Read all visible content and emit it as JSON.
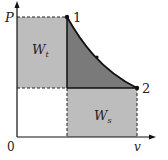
{
  "diagram": {
    "type": "P-v thermodynamic diagram",
    "axes": {
      "y_label": "P",
      "x_label": "v",
      "origin_label": "0"
    },
    "points": [
      {
        "id": "1",
        "label": "1"
      },
      {
        "id": "2",
        "label": "2"
      }
    ],
    "regions": {
      "left_region": {
        "main": "W",
        "sub": "t"
      },
      "bottom_region": {
        "main": "W",
        "sub": "s"
      }
    },
    "colors": {
      "light_fill": "#bdbdbd",
      "dark_fill": "#7a7a7a",
      "line": "#111111",
      "background": "#ffffff"
    }
  }
}
